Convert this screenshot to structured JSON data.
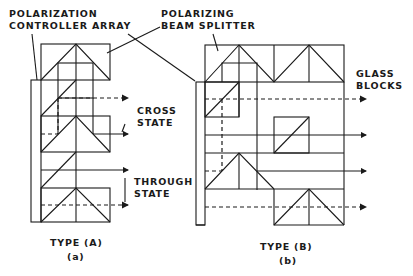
{
  "labels": {
    "pca": [
      "POLARIZATION",
      "CONTROLLER ARRAY"
    ],
    "pbs": [
      "POLARIZING",
      "BEAM SPLITTER"
    ],
    "cross": [
      "CROSS",
      "STATE"
    ],
    "through": [
      "THROUGH",
      "STATE"
    ],
    "glass": [
      "GLASS",
      "BLOCKS"
    ],
    "typeA": "TYPE (A)",
    "typeAsub": "(a)",
    "typeB": "TYPE (B)",
    "typeBsub": "(b)"
  },
  "colors": {
    "ink": "#1a1a1a",
    "background": "#ffffff"
  }
}
